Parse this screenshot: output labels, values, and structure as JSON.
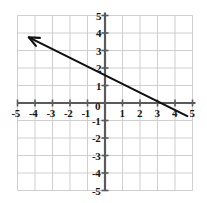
{
  "figure": {
    "name": "cartesian-coordinate-plane",
    "background_color": "#ffffff",
    "grid_color": "#c9c9c9",
    "axis_color": "#5a5a5a",
    "line_color": "#111111",
    "label_color": "#161616",
    "origin_label": "0"
  },
  "chart_data": {
    "type": "line",
    "title": "",
    "xlabel": "",
    "ylabel": "",
    "xlim": [
      -5,
      5
    ],
    "ylim": [
      -5,
      5
    ],
    "grid": true,
    "legend": "none",
    "x_ticks": [
      -5,
      -4,
      -3,
      -2,
      -1,
      0,
      1,
      2,
      3,
      4,
      5
    ],
    "y_ticks": [
      -5,
      -4,
      -3,
      -2,
      -1,
      0,
      1,
      2,
      3,
      4,
      5
    ],
    "x_tick_labels": [
      "-5",
      "-4",
      "-3",
      "-2",
      "-1",
      "0",
      "1",
      "2",
      "3",
      "4",
      "5"
    ],
    "y_tick_labels": [
      "-5",
      "-4",
      "-3",
      "-2",
      "-1",
      "0",
      "1",
      "2",
      "3",
      "4",
      "5"
    ],
    "series": [
      {
        "name": "ray-with-arrow",
        "type": "ray",
        "slope": -0.5,
        "y_intercept": 1.6,
        "x_intercept": 3.2,
        "equation": "y = -0.5x + 1.6",
        "points": [
          [
            4.7,
            -0.75
          ],
          [
            -4.35,
            3.75
          ]
        ],
        "arrow_at": "start-end-upper-left",
        "arrow_point": [
          -4.35,
          3.75
        ],
        "color": "#111111"
      }
    ]
  },
  "x_axis_labels": [
    {
      "text": "-5",
      "value": -5
    },
    {
      "text": "-4",
      "value": -4
    },
    {
      "text": "-3",
      "value": -3
    },
    {
      "text": "-2",
      "value": -2
    },
    {
      "text": "-1",
      "value": -1
    },
    {
      "text": "1",
      "value": 1
    },
    {
      "text": "2",
      "value": 2
    },
    {
      "text": "3",
      "value": 3
    },
    {
      "text": "4",
      "value": 4
    },
    {
      "text": "5",
      "value": 5
    }
  ],
  "y_axis_labels": [
    {
      "text": "5",
      "value": 5
    },
    {
      "text": "4",
      "value": 4
    },
    {
      "text": "3",
      "value": 3
    },
    {
      "text": "2",
      "value": 2
    },
    {
      "text": "1",
      "value": 1
    },
    {
      "text": "-1",
      "value": -1
    },
    {
      "text": "-2",
      "value": -2
    },
    {
      "text": "-3",
      "value": -3
    },
    {
      "text": "-4",
      "value": -4
    },
    {
      "text": "-5",
      "value": -5
    }
  ]
}
